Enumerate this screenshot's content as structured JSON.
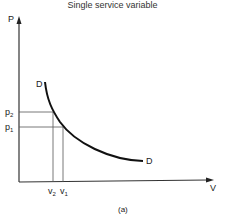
{
  "title": "Single service variable",
  "caption": "(a)",
  "axes": {
    "y_label": "P",
    "x_label": "V"
  },
  "curve": {
    "label_start": "D",
    "label_end": "D"
  },
  "price_marks": [
    {
      "main": "p",
      "sub": "2"
    },
    {
      "main": "p",
      "sub": "1"
    }
  ],
  "volume_marks": [
    {
      "main": "v",
      "sub": "2"
    },
    {
      "main": "v",
      "sub": "1"
    }
  ]
}
